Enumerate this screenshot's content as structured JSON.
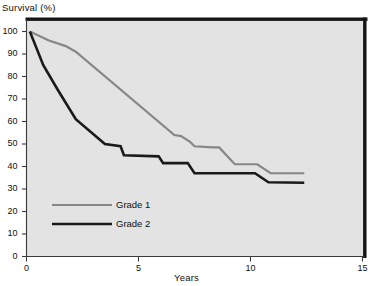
{
  "chart_data": {
    "type": "line",
    "title": "",
    "xlabel": "Years",
    "ylabel": "Survival (%)",
    "xlim": [
      0,
      15
    ],
    "ylim": [
      0,
      100
    ],
    "xticks": [
      0,
      5,
      10,
      15
    ],
    "yticks": [
      0,
      10,
      20,
      30,
      40,
      50,
      60,
      70,
      80,
      90,
      100
    ],
    "xtick_labels": [
      "0",
      "5",
      "10",
      "15"
    ],
    "ytick_labels": [
      "0",
      "10",
      "20",
      "30",
      "40",
      "50",
      "60",
      "70",
      "80",
      "90",
      "100"
    ],
    "grid": false,
    "legend_position": "center-left",
    "plot_background": "#e3e3e3",
    "series": [
      {
        "name": "Grade 1",
        "color": "#878787",
        "line_width": 2.2,
        "points": [
          [
            0.15,
            100
          ],
          [
            1.0,
            96
          ],
          [
            1.75,
            93.5
          ],
          [
            2.2,
            91
          ],
          [
            6.6,
            54
          ],
          [
            6.9,
            53.5
          ],
          [
            7.3,
            51
          ],
          [
            7.5,
            49
          ],
          [
            8.3,
            48.5
          ],
          [
            8.6,
            48.5
          ],
          [
            9.3,
            41
          ],
          [
            10.3,
            41
          ],
          [
            10.9,
            37
          ],
          [
            12.4,
            37
          ]
        ]
      },
      {
        "name": "Grade 2",
        "color": "#1a1a1a",
        "line_width": 2.6,
        "points": [
          [
            0.15,
            100
          ],
          [
            0.75,
            85
          ],
          [
            1.4,
            74
          ],
          [
            2.2,
            61
          ],
          [
            3.5,
            50
          ],
          [
            4.2,
            49
          ],
          [
            4.35,
            45
          ],
          [
            5.9,
            44.5
          ],
          [
            6.1,
            41.5
          ],
          [
            7.2,
            41.5
          ],
          [
            7.5,
            37
          ],
          [
            10.2,
            37
          ],
          [
            10.8,
            33
          ],
          [
            12.4,
            32.8
          ]
        ]
      }
    ]
  },
  "legend": {
    "items": [
      {
        "label": "Grade 1",
        "color": "#878787"
      },
      {
        "label": "Grade 2",
        "color": "#1a1a1a"
      }
    ]
  }
}
